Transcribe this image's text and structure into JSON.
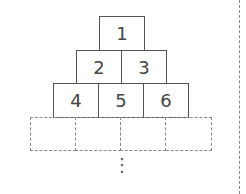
{
  "diagram": {
    "type": "number-pyramid",
    "rows": [
      {
        "cells": [
          "1"
        ]
      },
      {
        "cells": [
          "2",
          "3"
        ]
      },
      {
        "cells": [
          "4",
          "5",
          "6"
        ]
      },
      {
        "cells": [
          "",
          "",
          "",
          ""
        ],
        "style": "dashed"
      }
    ],
    "continuation": "⋮",
    "colors": {
      "border": "#555555",
      "dashed": "#888888",
      "text": "#444444"
    }
  }
}
